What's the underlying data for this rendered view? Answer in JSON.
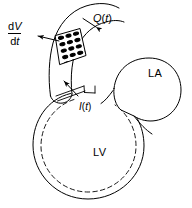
{
  "figure": {
    "background_color": "#ffffff",
    "stroke_color": "#000000",
    "fill_color": "#ffffff"
  },
  "labels": {
    "volume_derivative": {
      "numerator": "dV",
      "denominator": "dt",
      "meaning": "rate of change of volume"
    },
    "flow": "Q(t)",
    "current": "I(t)",
    "left_atrium": "LA",
    "left_ventricle": "LV"
  },
  "annotations": {
    "dv_dt_arrow": "arrow-pointing-left-from-compliance-region",
    "q_t_arrow": "arrow-pointing-down-left-to-aortic-wall",
    "i_t_arrow": "arrow-pointing-up-left-through-aortic-valve"
  },
  "regions": {
    "aorta": "curved-arch-vessel-top-left",
    "compliance_patch": "dotted-parallelogram-on-aortic-wall",
    "left_atrium": "rounded-chamber-right",
    "left_ventricle": "large-circular-chamber-bottom",
    "lv_inner_wall": "dashed-inner-contour"
  }
}
